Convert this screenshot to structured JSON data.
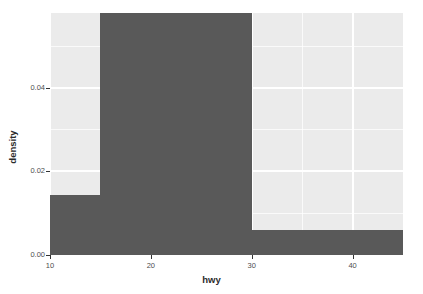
{
  "chart_data": {
    "type": "bar",
    "title": "",
    "subtitle": "",
    "xlabel": "hwy",
    "ylabel": "density",
    "xlim": [
      10,
      45
    ],
    "ylim": [
      0,
      0.0578
    ],
    "grid": true,
    "legend": "none",
    "bin_width": 5,
    "bar_color": "#595959",
    "panel_background": "#ebebeb",
    "gridline_color": "#ffffff",
    "bins": [
      {
        "label": "10-15",
        "x_start": 10,
        "x_end": 15,
        "density": 0.0143
      },
      {
        "label": "15-30",
        "x_start": 15,
        "x_end": 30,
        "density": 0.0578
      },
      {
        "label": "30-45",
        "x_start": 30,
        "x_end": 45,
        "density": 0.0059
      }
    ],
    "categories": [
      "10-15",
      "15-30",
      "30-45"
    ],
    "values": [
      0.0143,
      0.0578,
      0.0059
    ],
    "x_ticks": [
      {
        "value": 10,
        "label": "10"
      },
      {
        "value": 20,
        "label": "20"
      },
      {
        "value": 30,
        "label": "30"
      },
      {
        "value": 40,
        "label": "40"
      }
    ],
    "x_minor_ticks": [
      15,
      25,
      35,
      45
    ],
    "y_ticks": [
      {
        "value": 0.0,
        "label": "0.00"
      },
      {
        "value": 0.02,
        "label": "0.02"
      },
      {
        "value": 0.04,
        "label": "0.04"
      }
    ],
    "y_minor_ticks": [
      0.01,
      0.03,
      0.05
    ]
  }
}
